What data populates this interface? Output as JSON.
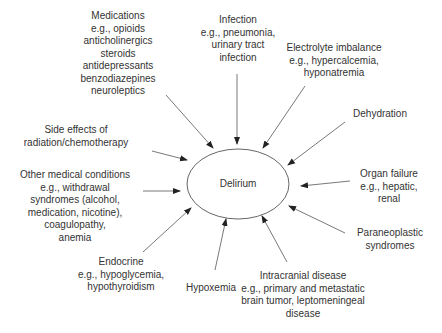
{
  "center": {
    "label": "Delirium"
  },
  "causes": [
    {
      "id": "medications",
      "lines": [
        "Medications",
        "e.g., opioids",
        "anticholinergics",
        "steroids",
        "antidepressants",
        "benzodiazepines",
        "neuroleptics"
      ]
    },
    {
      "id": "infection",
      "lines": [
        "Infection",
        "e.g., pneumonia,",
        "urinary tract",
        "infection"
      ]
    },
    {
      "id": "electrolyte",
      "lines": [
        "Electrolyte imbalance",
        "e.g., hypercalcemia,",
        "hyponatremia"
      ]
    },
    {
      "id": "dehydration",
      "lines": [
        "Dehydration"
      ]
    },
    {
      "id": "side-effects",
      "lines": [
        "Side effects of",
        "radiation/chemotherapy"
      ]
    },
    {
      "id": "organ-failure",
      "lines": [
        "Organ failure",
        "e.g., hepatic,",
        "renal"
      ]
    },
    {
      "id": "other-medical",
      "lines": [
        "Other medical conditions",
        "e.g., withdrawal",
        "syndromes (alcohol,",
        "medication, nicotine),",
        "coagulopathy,",
        "anemia"
      ]
    },
    {
      "id": "paraneoplastic",
      "lines": [
        "Paraneoplastic",
        "syndromes"
      ]
    },
    {
      "id": "endocrine",
      "lines": [
        "Endocrine",
        "e.g., hypoglycemia,",
        "hypothyroidism"
      ]
    },
    {
      "id": "hypoxemia",
      "lines": [
        "Hypoxemia"
      ]
    },
    {
      "id": "intracranial",
      "lines": [
        "Intracranial disease",
        "e.g., primary and metastatic",
        "brain tumor, leptomeningeal",
        "disease"
      ]
    }
  ],
  "colors": {
    "line": "#555555",
    "text": "#333333"
  }
}
